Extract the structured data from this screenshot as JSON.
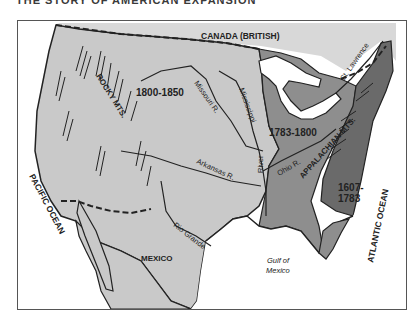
{
  "title": "THE STORY OF AMERICAN EXPANSION",
  "map": {
    "regions": {
      "canada": "CANADA (BRITISH)",
      "mexico": "MEXICO",
      "pacific": "PACIFIC OCEAN",
      "atlantic": "ATLANTIC OCEAN",
      "gulf_line1": "Gulf of",
      "gulf_line2": "Mexico"
    },
    "periods": [
      {
        "label": "1800-1850",
        "color": "#c9c9c9"
      },
      {
        "label": "1783-1800",
        "color": "#8e8e8e"
      },
      {
        "label_line1": "1607-",
        "label_line2": "1783",
        "color": "#6a6a6a"
      }
    ],
    "features": {
      "rocky": "ROCKY MTS.",
      "appalachian": "APPALACHIAN MTS.",
      "missouri": "Missouri R.",
      "mississippi": "Mississippi",
      "mississippi_river": "River",
      "arkansas": "Arkansas R.",
      "ohio": "Ohio R.",
      "st_lawrence": "St. Lawrence",
      "rio_grande": "Rio Grande"
    },
    "colors": {
      "canada": "#d8d8d8",
      "west": "#c9c9c9",
      "middle": "#8e8e8e",
      "east": "#6a6a6a",
      "water": "#ffffff",
      "outline": "#222222"
    }
  }
}
